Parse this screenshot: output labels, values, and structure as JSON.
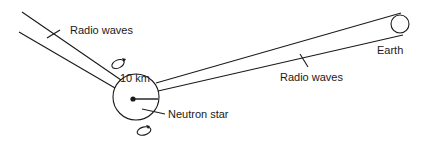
{
  "diagram": {
    "labels": {
      "radio_waves_left": "Radio waves",
      "radio_waves_right": "Radio waves",
      "radius": "10 km",
      "neutron_star": "Neutron star",
      "earth": "Earth"
    },
    "colors": {
      "ink": "#1a1a1a",
      "background": "#ffffff"
    }
  }
}
